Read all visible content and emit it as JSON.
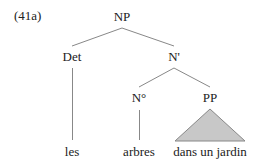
{
  "example": {
    "label": "(41a)"
  },
  "tree": {
    "nodes": {
      "np": "NP",
      "det": "Det",
      "nbar": "N'",
      "n0": "N°",
      "pp": "PP"
    },
    "leaves": {
      "les": "les",
      "arbres": "arbres",
      "pp_phrase": "dans un jardin"
    },
    "triangle_fill": "#c8c8c8",
    "line_color": "#888888"
  }
}
